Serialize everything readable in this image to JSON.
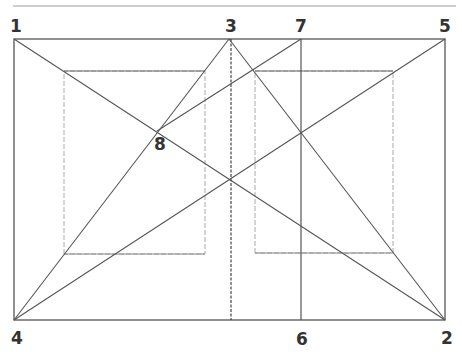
{
  "diagram": {
    "type": "golden-section construction",
    "colors": {
      "line": "#555555",
      "guide": "#aaaaaa",
      "label": "#333333"
    },
    "points": [
      {
        "label": "1",
        "x": 14,
        "y": 39
      },
      {
        "label": "2",
        "x": 445,
        "y": 320
      },
      {
        "label": "3",
        "x": 229,
        "y": 39
      },
      {
        "label": "4",
        "x": 14,
        "y": 320
      },
      {
        "label": "5",
        "x": 445,
        "y": 39
      },
      {
        "label": "6",
        "x": 301,
        "y": 320
      },
      {
        "label": "7",
        "x": 301,
        "y": 39
      },
      {
        "label": "8",
        "x": 157,
        "y": 131
      }
    ],
    "labels": {
      "p1": "1",
      "p2": "2",
      "p3": "3",
      "p4": "4",
      "p5": "5",
      "p6": "6",
      "p7": "7",
      "p8": "8"
    }
  }
}
